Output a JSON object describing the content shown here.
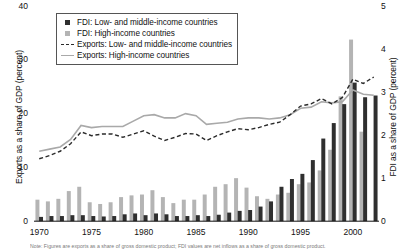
{
  "legend": {
    "items": [
      {
        "label": "FDI: Low- and middle-income countries",
        "marker": "dark-square-icon"
      },
      {
        "label": "FDI: High-income countries",
        "marker": "light-square-icon"
      },
      {
        "label": "Exports: Low- and middle-income countries",
        "marker": "dashed-line-icon"
      },
      {
        "label": "Exports: High-income countries",
        "marker": "solid-line-icon"
      }
    ]
  },
  "note": {
    "text": "Note: Figures are exports as a share of gross domestic product; FDI values are net inflows as a share of gross domestic product."
  },
  "colors": {
    "fdi_low_middle": "#2f2f2f",
    "fdi_high": "#b4b4b4",
    "exports_low_middle": "#2a2a2a",
    "exports_high": "#a9a9a9",
    "background": "#ffffff",
    "axis": "#111111"
  },
  "chart_data": {
    "type": "bar",
    "title": "",
    "xlabel": "",
    "ylabel": "Exports as a share of GDP (percent)",
    "y2label": "FDI as a share of GDP (percent)",
    "ylim": [
      0,
      40
    ],
    "y2lim": [
      0,
      5
    ],
    "yticks": [
      0,
      10,
      20,
      30,
      40
    ],
    "y2ticks": [
      0,
      1,
      2,
      3,
      4,
      5
    ],
    "xticks": [
      1970,
      1975,
      1980,
      1985,
      1990,
      1995,
      2000
    ],
    "grid": false,
    "legend_position": "upper-left",
    "x": [
      1970,
      1971,
      1972,
      1973,
      1974,
      1975,
      1976,
      1977,
      1978,
      1979,
      1980,
      1981,
      1982,
      1983,
      1984,
      1985,
      1986,
      1987,
      1988,
      1989,
      1990,
      1991,
      1992,
      1993,
      1994,
      1995,
      1996,
      1997,
      1998,
      1999,
      2000,
      2001,
      2002
    ],
    "series": [
      {
        "name": "FDI: Low- and middle-income countries",
        "axis": "right",
        "chart_type": "bar",
        "color": "#2f2f2f",
        "values": [
          0.1,
          0.12,
          0.12,
          0.14,
          0.14,
          0.12,
          0.11,
          0.12,
          0.16,
          0.18,
          0.14,
          0.18,
          0.16,
          0.12,
          0.12,
          0.14,
          0.12,
          0.15,
          0.2,
          0.24,
          0.26,
          0.34,
          0.46,
          0.8,
          0.98,
          1.1,
          1.42,
          1.92,
          2.28,
          2.72,
          3.22,
          2.88,
          2.92
        ],
        "unit": "percent of GDP"
      },
      {
        "name": "FDI: High-income countries",
        "axis": "right",
        "chart_type": "bar",
        "color": "#b4b4b4",
        "values": [
          0.5,
          0.46,
          0.52,
          0.7,
          0.8,
          0.44,
          0.4,
          0.44,
          0.56,
          0.6,
          0.62,
          0.72,
          0.56,
          0.42,
          0.5,
          0.5,
          0.62,
          0.8,
          0.86,
          1.0,
          0.78,
          0.58,
          0.52,
          0.62,
          0.66,
          0.86,
          0.9,
          1.18,
          1.66,
          2.9,
          4.22,
          2.08,
          0.0
        ],
        "unit": "percent of GDP"
      },
      {
        "name": "Exports: Low- and middle-income countries",
        "axis": "left",
        "chart_type": "line",
        "style": "dashed",
        "color": "#2a2a2a",
        "values": [
          11.6,
          12.2,
          13.0,
          14.4,
          16.6,
          15.9,
          16.2,
          16.2,
          15.6,
          16.2,
          16.8,
          15.8,
          15.0,
          15.6,
          16.3,
          16.2,
          15.0,
          15.9,
          16.6,
          17.2,
          17.0,
          17.4,
          18.0,
          18.4,
          19.8,
          21.4,
          21.8,
          22.8,
          21.8,
          23.0,
          26.4,
          25.6,
          26.8
        ],
        "unit": "percent of GDP"
      },
      {
        "name": "Exports: High-income countries",
        "axis": "left",
        "chart_type": "line",
        "style": "solid",
        "color": "#a9a9a9",
        "values": [
          13.0,
          13.4,
          13.8,
          15.2,
          17.8,
          17.4,
          17.6,
          17.6,
          17.6,
          18.6,
          19.6,
          19.8,
          19.2,
          19.2,
          20.0,
          19.6,
          18.0,
          18.2,
          18.4,
          19.0,
          19.2,
          19.2,
          19.0,
          19.2,
          19.8,
          21.0,
          21.2,
          22.2,
          22.0,
          22.2,
          24.4,
          23.6,
          23.4
        ],
        "unit": "percent of GDP"
      }
    ]
  }
}
